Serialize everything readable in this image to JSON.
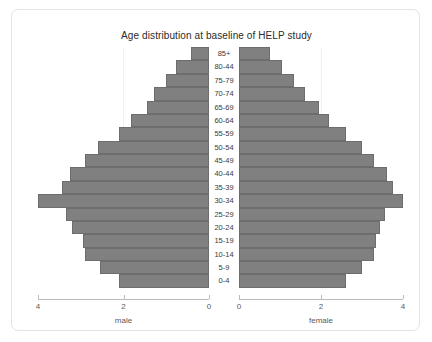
{
  "chart_data": {
    "type": "bar",
    "subtype": "population-pyramid",
    "title": "Age distribution at baseline of HELP study",
    "categories": [
      "85+",
      "80-44",
      "75-79",
      "70-74",
      "65-69",
      "60-64",
      "55-59",
      "50-54",
      "45-49",
      "40-44",
      "35-39",
      "30-34",
      "25-29",
      "20-24",
      "15-19",
      "10-14",
      "5-9",
      "0-4"
    ],
    "series": [
      {
        "name": "male",
        "axis_label": "male",
        "direction": "left",
        "values": [
          0.42,
          0.78,
          1.0,
          1.28,
          1.45,
          1.82,
          2.1,
          2.6,
          2.9,
          3.25,
          3.45,
          4.0,
          3.35,
          3.2,
          2.95,
          2.9,
          2.55,
          2.1
        ]
      },
      {
        "name": "female",
        "axis_label": "female",
        "direction": "right",
        "values": [
          0.75,
          1.05,
          1.35,
          1.62,
          1.95,
          2.2,
          2.6,
          3.0,
          3.3,
          3.6,
          3.75,
          4.0,
          3.55,
          3.45,
          3.35,
          3.3,
          3.0,
          2.6
        ]
      }
    ],
    "xlabel_left": "male",
    "xlabel_right": "female",
    "ylabel": "",
    "xlim": [
      0,
      4
    ],
    "x_ticks_left": [
      "4",
      "2",
      "0"
    ],
    "x_ticks_right": [
      "0",
      "2",
      "4"
    ],
    "grid": true,
    "legend": "none",
    "colors": {
      "bar_fill": "#808080",
      "bar_stroke": "#6d6d6d",
      "axis": "#bcbcbc",
      "gridline": "#f1f1f1",
      "text": "#3a3a3a",
      "panel_border": "#e3e3e3",
      "background": "#ffffff"
    }
  }
}
